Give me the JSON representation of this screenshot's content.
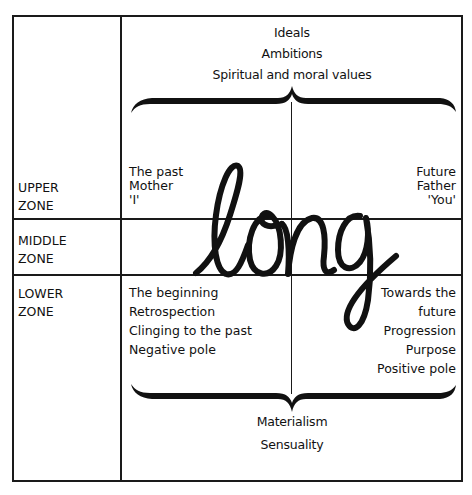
{
  "diagram": {
    "word": "long",
    "top_labels": [
      "Ideals",
      "Ambitions",
      "Spiritual and moral values"
    ],
    "bottom_labels": [
      "Materialism",
      "Sensuality"
    ],
    "zones": {
      "upper": {
        "line1": "UPPER",
        "line2": "ZONE"
      },
      "middle": {
        "line1": "MIDDLE",
        "line2": "ZONE"
      },
      "lower": {
        "line1": "LOWER",
        "line2": "ZONE"
      }
    },
    "upper_left": [
      "The past",
      "Mother",
      "'I'"
    ],
    "upper_right": [
      "Future",
      "Father",
      "'You'"
    ],
    "lower_left": [
      "The beginning",
      "Retrospection",
      "Clinging to the past",
      "Negative pole"
    ],
    "lower_right": [
      "Towards the",
      "future",
      "Progression",
      "Purpose",
      "Positive pole"
    ],
    "colors": {
      "ink": "#111111",
      "background": "#ffffff"
    }
  }
}
